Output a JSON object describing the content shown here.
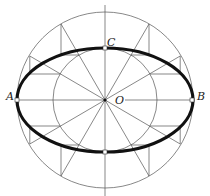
{
  "diagram": {
    "center": {
      "x": 105,
      "y": 100
    },
    "outer_radius": 88,
    "inner_radius": 52,
    "ray_angles_deg": [
      0,
      30,
      60,
      90,
      120,
      150,
      180,
      210,
      240,
      270,
      300,
      330
    ],
    "labels": {
      "A": "A",
      "B": "B",
      "C": "C",
      "O": "O"
    },
    "colors": {
      "ellipse": "#111111",
      "construction": "#555555",
      "background": "#ffffff"
    }
  }
}
